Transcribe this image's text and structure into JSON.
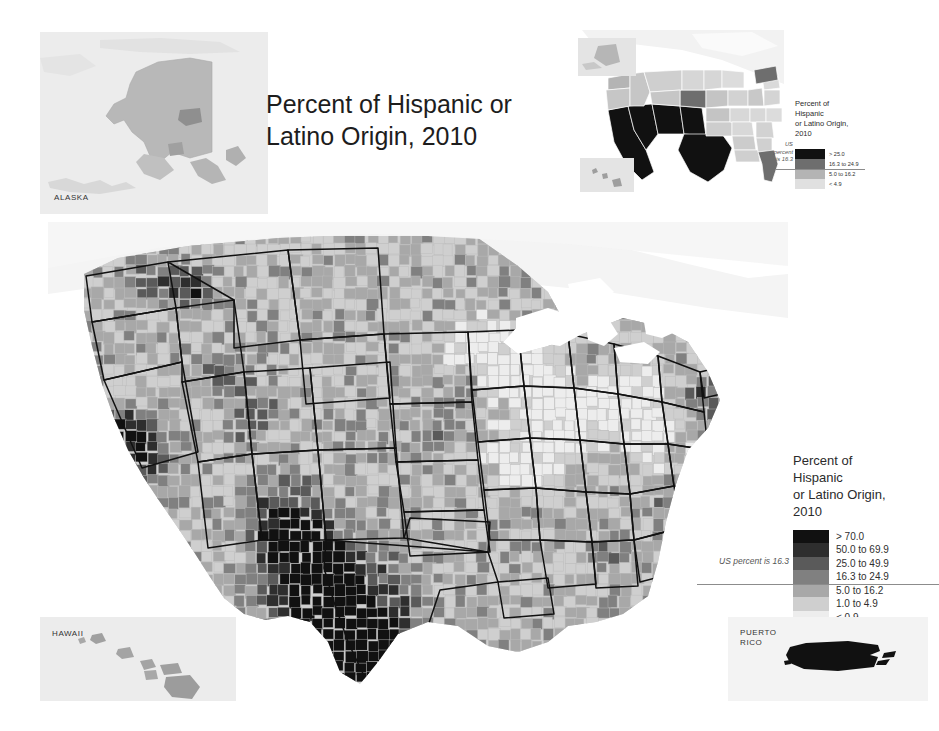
{
  "title": "Percent of\nHispanic or Latino Origin,\n2010",
  "insets": {
    "alaska_label": "ALASKA",
    "hawaii_label": "HAWAII",
    "puerto_rico_label": "PUERTO\nRICO"
  },
  "main_legend": {
    "title": "Percent of\nHispanic\nor Latino Origin,\n2010",
    "us_note": "US percent is 16.3",
    "classes": [
      {
        "label": "> 70.0",
        "color": "#111111"
      },
      {
        "label": "50.0 to 69.9",
        "color": "#2e2e2e"
      },
      {
        "label": "25.0 to 49.9",
        "color": "#5a5a5a"
      },
      {
        "label": "16.3 to 24.9",
        "color": "#808080"
      },
      {
        "label": "5.0 to 16.2",
        "color": "#a8a8a8"
      },
      {
        "label": "1.0 to 4.9",
        "color": "#cfcfcf"
      },
      {
        "label": "< 0.9",
        "color": "#ededed"
      }
    ]
  },
  "inset_legend": {
    "title": "Percent of\nHispanic\nor Latino Origin,\n2010",
    "us_note": "US\npercent\nis 16.3",
    "classes": [
      {
        "label": "> 25.0",
        "color": "#111111"
      },
      {
        "label": "16.3 to 24.9",
        "color": "#6e6e6e"
      },
      {
        "label": "5.0 to 16.2",
        "color": "#b4b4b4"
      },
      {
        "label": "< 4.9",
        "color": "#e0e0e0"
      }
    ]
  },
  "chart_data": {
    "type": "heatmap",
    "title": "Percent of Hispanic or Latino Origin, 2010",
    "subtitle": "County-level choropleth of the United States",
    "unit": "percent",
    "national_value": 16.3,
    "classification": "7-class graduated gray scale",
    "legend_position": "right-middle",
    "bins": [
      {
        "label": "> 70.0",
        "min": 70.0,
        "max": 100.0,
        "color": "#111111"
      },
      {
        "label": "50.0 to 69.9",
        "min": 50.0,
        "max": 69.9,
        "color": "#2e2e2e"
      },
      {
        "label": "25.0 to 49.9",
        "min": 25.0,
        "max": 49.9,
        "color": "#5a5a5a"
      },
      {
        "label": "16.3 to 24.9",
        "min": 16.3,
        "max": 24.9,
        "color": "#808080"
      },
      {
        "label": "5.0 to 16.2",
        "min": 5.0,
        "max": 16.2,
        "color": "#a8a8a8"
      },
      {
        "label": "1.0 to 4.9",
        "min": 1.0,
        "max": 4.9,
        "color": "#cfcfcf"
      },
      {
        "label": "< 0.9",
        "min": 0.0,
        "max": 0.9,
        "color": "#ededed"
      }
    ],
    "state_inset_bins": [
      {
        "label": "> 25.0",
        "color": "#111111"
      },
      {
        "label": "16.3 to 24.9",
        "color": "#6e6e6e"
      },
      {
        "label": "5.0 to 16.2",
        "color": "#b4b4b4"
      },
      {
        "label": "< 4.9",
        "color": "#e0e0e0"
      }
    ],
    "state_values": [
      {
        "state": "California",
        "bin": "> 25.0"
      },
      {
        "state": "Texas",
        "bin": "> 25.0"
      },
      {
        "state": "New Mexico",
        "bin": "> 25.0"
      },
      {
        "state": "Arizona",
        "bin": "> 25.0"
      },
      {
        "state": "Nevada",
        "bin": "> 25.0"
      },
      {
        "state": "Colorado",
        "bin": "16.3 to 24.9"
      },
      {
        "state": "Florida",
        "bin": "16.3 to 24.9"
      },
      {
        "state": "New York",
        "bin": "16.3 to 24.9"
      },
      {
        "state": "New Jersey",
        "bin": "16.3 to 24.9"
      },
      {
        "state": "Illinois",
        "bin": "5.0 to 16.2"
      },
      {
        "state": "Washington",
        "bin": "5.0 to 16.2"
      },
      {
        "state": "Oregon",
        "bin": "5.0 to 16.2"
      },
      {
        "state": "Idaho",
        "bin": "5.0 to 16.2"
      },
      {
        "state": "Utah",
        "bin": "5.0 to 16.2"
      },
      {
        "state": "Kansas",
        "bin": "5.0 to 16.2"
      },
      {
        "state": "Oklahoma",
        "bin": "5.0 to 16.2"
      },
      {
        "state": "Nebraska",
        "bin": "5.0 to 16.2"
      },
      {
        "state": "Connecticut",
        "bin": "5.0 to 16.2"
      },
      {
        "state": "Rhode Island",
        "bin": "5.0 to 16.2"
      },
      {
        "state": "Massachusetts",
        "bin": "5.0 to 16.2"
      },
      {
        "state": "Alaska",
        "bin": "< 4.9"
      },
      {
        "state": "Hawaii",
        "bin": "5.0 to 16.2"
      },
      {
        "state": "Puerto Rico",
        "bin": "> 70.0"
      }
    ],
    "notable_regions": [
      {
        "region": "South Texas border counties",
        "bin": "> 70.0"
      },
      {
        "region": "Northern New Mexico",
        "bin": "50.0 to 69.9"
      },
      {
        "region": "Imperial Valley, California",
        "bin": "> 70.0"
      },
      {
        "region": "Central Washington",
        "bin": "25.0 to 49.9"
      },
      {
        "region": "Upper Midwest / Appalachia",
        "bin": "< 0.9"
      },
      {
        "region": "Puerto Rico",
        "bin": "> 70.0"
      }
    ]
  }
}
